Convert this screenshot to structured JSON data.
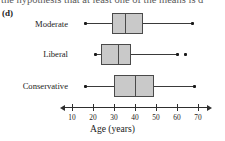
{
  "top_fragment": "the hypothesis that at least one of the means is d",
  "part_label": "(d)",
  "axis": {
    "title": "Age (years)",
    "ticks": [
      10,
      20,
      30,
      40,
      50,
      60,
      70
    ],
    "tick_labels": [
      "10",
      "20",
      "30",
      "40",
      "50",
      "60",
      "70"
    ],
    "range": [
      4,
      76
    ]
  },
  "categories": [
    "Moderate",
    "Liberal",
    "Conservative"
  ],
  "colors": {
    "box_fill": "#c9c9c9",
    "box_stroke": "#4a4a4a",
    "whisker": "#3a3a3a",
    "marker": "#1a1a1a",
    "axis": "#2e2e2e",
    "text": "#1c1c1c"
  },
  "chart_data": {
    "type": "boxplot",
    "title": "",
    "xlabel": "Age (years)",
    "ylabel": "",
    "orientation": "horizontal",
    "xlim": [
      4,
      76
    ],
    "grid": false,
    "legend": "none",
    "categories": [
      "Moderate",
      "Liberal",
      "Conservative"
    ],
    "series": [
      {
        "name": "Moderate",
        "min": 16,
        "q1": 29,
        "median": 35,
        "q3": 44,
        "max": 67,
        "outliers": []
      },
      {
        "name": "Liberal",
        "min": 21,
        "q1": 24,
        "median": 32,
        "q3": 38,
        "max": 60,
        "outliers": [
          64
        ]
      },
      {
        "name": "Conservative",
        "min": 16,
        "q1": 30,
        "median": 40,
        "q3": 49,
        "max": 68,
        "outliers": []
      }
    ]
  }
}
